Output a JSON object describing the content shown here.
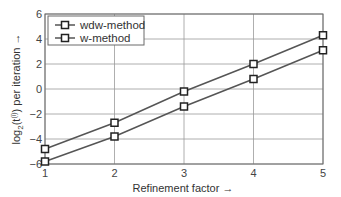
{
  "chart_data": {
    "type": "line",
    "title": "",
    "xlabel": "Refinement factor →",
    "ylabel": "log₂(t^(i)) per iteration →",
    "ylabel_parts": {
      "pre": "log",
      "sub": "2",
      "mid": "(t",
      "sup": "(i)",
      "post": ") per iteration →"
    },
    "x": [
      1,
      2,
      3,
      4,
      5
    ],
    "xlim": [
      1,
      5
    ],
    "ylim": [
      -6,
      6
    ],
    "xticks": [
      1,
      2,
      3,
      4,
      5
    ],
    "yticks": [
      -6,
      -4,
      -2,
      0,
      2,
      4,
      6
    ],
    "grid": true,
    "legend_position": "upper left",
    "series": [
      {
        "name": "wdw-method",
        "values": [
          -4.8,
          -2.7,
          -0.2,
          2.0,
          4.3
        ],
        "marker": "square",
        "color": "#555555"
      },
      {
        "name": "w-method",
        "values": [
          -5.8,
          -3.8,
          -1.4,
          0.8,
          3.1
        ],
        "marker": "square",
        "color": "#555555"
      }
    ]
  },
  "colors": {
    "grid": "#9a9a9a",
    "axis": "#6a6a6a",
    "line": "#555555",
    "marker_edge": "#222222"
  }
}
